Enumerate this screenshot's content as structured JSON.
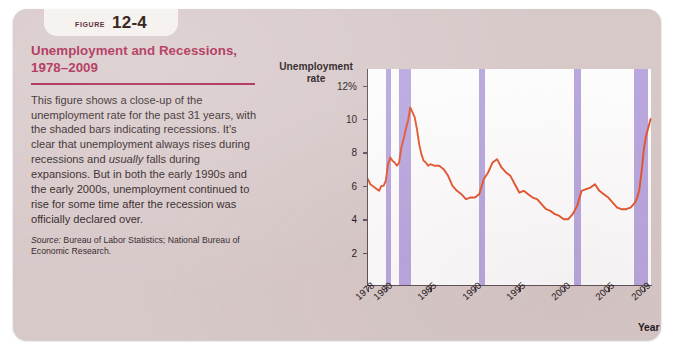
{
  "figure": {
    "tab_word": "Figure",
    "tab_number": "12-4",
    "title": "Unemployment and Recessions, 1978–2009",
    "body_part1": "This figure shows a close-up of the unemployment rate for the past 31 years, with the shaded bars indicating recessions. It's clear that unemployment always rises during recessions and ",
    "body_emphasis": "usually",
    "body_part2": " falls during expansions. But in both the early 1990s and the early 2000s, unemployment continued to rise for some time after the recession was officially declared over.",
    "source_label": "Source:",
    "source_text": " Bureau of Labor Statistics; National Bureau of Economic Research."
  },
  "colors": {
    "panel_background": "#d8c9c9",
    "tab_background": "#f6f2f0",
    "title_color": "#a8204c",
    "plot_background": "#fdfcfd",
    "line_color": "#e4552e",
    "recession_bar_color": "#b9a7de",
    "axis_color": "#5f5158"
  },
  "chart_data": {
    "type": "line",
    "title": "Unemployment and Recessions, 1978–2009",
    "ylabel": "Unemployment rate",
    "xlabel": "Year",
    "grid": false,
    "legend": null,
    "ylim": [
      0,
      13
    ],
    "xlim": [
      1978,
      2009.8
    ],
    "y_ticks": [
      2,
      4,
      6,
      8,
      10,
      12
    ],
    "y_tick_labels": [
      "2",
      "4",
      "6",
      "8",
      "10",
      "12%"
    ],
    "x_ticks": [
      1978,
      1980,
      1985,
      1990,
      1995,
      2000,
      2005,
      2009
    ],
    "x_tick_labels": [
      "1978",
      "1980",
      "1985",
      "1990",
      "1995",
      "2000",
      "2005",
      "2009"
    ],
    "series": [
      {
        "name": "Unemployment rate",
        "color": "#e4552e",
        "x": [
          1978.0,
          1978.25,
          1978.5,
          1978.75,
          1979.0,
          1979.25,
          1979.5,
          1979.75,
          1980.0,
          1980.25,
          1980.5,
          1980.75,
          1981.0,
          1981.25,
          1981.5,
          1981.75,
          1982.0,
          1982.25,
          1982.5,
          1982.75,
          1983.0,
          1983.25,
          1983.5,
          1983.75,
          1984.0,
          1984.25,
          1984.5,
          1984.75,
          1985.0,
          1985.5,
          1986.0,
          1986.5,
          1987.0,
          1987.5,
          1988.0,
          1988.5,
          1989.0,
          1989.5,
          1990.0,
          1990.5,
          1991.0,
          1991.5,
          1992.0,
          1992.5,
          1993.0,
          1993.5,
          1994.0,
          1994.5,
          1995.0,
          1995.5,
          1996.0,
          1996.5,
          1997.0,
          1997.5,
          1998.0,
          1998.5,
          1999.0,
          1999.5,
          2000.0,
          2000.5,
          2001.0,
          2001.5,
          2002.0,
          2002.5,
          2003.0,
          2003.5,
          2004.0,
          2004.5,
          2005.0,
          2005.5,
          2006.0,
          2006.5,
          2007.0,
          2007.5,
          2008.0,
          2008.25,
          2008.5,
          2008.75,
          2009.0,
          2009.25,
          2009.5,
          2009.75
        ],
        "y": [
          6.4,
          6.1,
          6.0,
          5.9,
          5.8,
          5.7,
          6.0,
          6.0,
          6.3,
          7.3,
          7.7,
          7.5,
          7.4,
          7.2,
          7.4,
          8.3,
          8.8,
          9.4,
          9.9,
          10.7,
          10.4,
          10.1,
          9.4,
          8.5,
          7.9,
          7.5,
          7.4,
          7.2,
          7.3,
          7.2,
          7.2,
          7.0,
          6.6,
          6.0,
          5.7,
          5.5,
          5.2,
          5.3,
          5.3,
          5.5,
          6.4,
          6.8,
          7.4,
          7.6,
          7.1,
          6.8,
          6.6,
          6.1,
          5.6,
          5.7,
          5.5,
          5.3,
          5.2,
          4.9,
          4.6,
          4.5,
          4.3,
          4.2,
          4.0,
          4.0,
          4.3,
          4.8,
          5.7,
          5.8,
          5.9,
          6.1,
          5.7,
          5.5,
          5.3,
          5.0,
          4.7,
          4.6,
          4.6,
          4.7,
          5.0,
          5.3,
          5.8,
          6.9,
          8.2,
          9.0,
          9.5,
          10.0
        ],
        "units": "percent"
      }
    ],
    "recessions": [
      {
        "label": "1980 recession",
        "start": 1980.0,
        "end": 1980.55
      },
      {
        "label": "1981–82 recession",
        "start": 1981.5,
        "end": 1982.85
      },
      {
        "label": "1990–91 recession",
        "start": 1990.5,
        "end": 1991.2
      },
      {
        "label": "2001 recession",
        "start": 2001.2,
        "end": 2001.9
      },
      {
        "label": "2007–09 recession",
        "start": 2007.9,
        "end": 2009.5
      }
    ],
    "annotations": [
      "Shaded bars indicate recessions (NBER)."
    ]
  }
}
